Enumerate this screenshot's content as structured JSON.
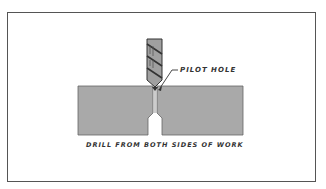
{
  "figure": {
    "callout_label": "PILOT HOLE",
    "caption": "DRILL FROM BOTH SIDES OF WORK"
  },
  "colors": {
    "workpiece": "#a9a9a9",
    "drill": "#a0a0a0",
    "outline": "#444444",
    "border": "#555555"
  }
}
